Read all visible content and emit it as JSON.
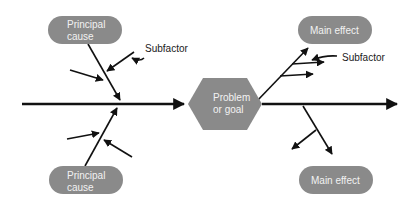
{
  "diagram": {
    "type": "fishbone (cause and effect)",
    "colors": {
      "box_fill": "#8a8a8a",
      "box_text": "#f2f2f2",
      "line": "#111111",
      "background": "#ffffff"
    },
    "center": {
      "line1": "Problem",
      "line2": "or goal"
    },
    "causes": [
      {
        "line1": "Principal",
        "line2": "cause",
        "position": "top-left"
      },
      {
        "line1": "Principal",
        "line2": "cause",
        "position": "bottom-left"
      }
    ],
    "effects": [
      {
        "label": "Main effect",
        "position": "top-right"
      },
      {
        "label": "Main effect",
        "position": "bottom-right"
      }
    ],
    "annotations": [
      {
        "label": "Subfactor",
        "position": "top-left"
      },
      {
        "label": "Subfactor",
        "position": "top-right"
      }
    ]
  }
}
